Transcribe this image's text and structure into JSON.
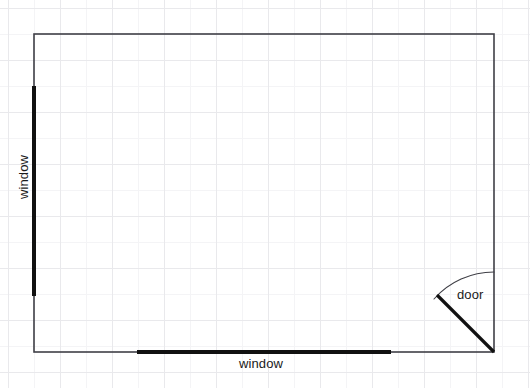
{
  "drawing": {
    "title": "room-floor-plan",
    "background": {
      "kind": "graph-paper",
      "minor_cell_px": 26,
      "major_cell_px": 52,
      "minor_color": "#f4f4f6",
      "major_color": "#e9e9ec",
      "paper_color": "#ffffff"
    },
    "canvas": {
      "width": 530,
      "height": 388
    },
    "room": {
      "name": "room-outline",
      "shape": "rectangle",
      "x": 34,
      "y": 34,
      "width": 460,
      "height": 318,
      "wall_color": "#3f3f46",
      "wall_thickness": 1.6
    },
    "openings": [
      {
        "id": "window-left",
        "type": "window",
        "label": "window",
        "wall": "left",
        "orientation": "vertical",
        "x": 34,
        "y1": 86,
        "y2": 296,
        "length": 210,
        "color": "#111111",
        "thickness": 4
      },
      {
        "id": "window-bottom",
        "type": "window",
        "label": "window",
        "wall": "bottom",
        "orientation": "horizontal",
        "y": 352,
        "x1": 137,
        "x2": 391,
        "length": 254,
        "color": "#111111",
        "thickness": 4
      },
      {
        "id": "door-bottom-right",
        "type": "door",
        "label": "door",
        "wall": "right",
        "hinge_x": 494,
        "hinge_y": 352,
        "radius": 80,
        "leaf_end_x": 437,
        "leaf_end_y": 295,
        "swing_start_x": 494,
        "swing_start_y": 272,
        "swing_degrees": 45,
        "leaf_color": "#111111",
        "leaf_thickness": 3.2,
        "arc_color": "#3f3f46",
        "arc_thickness": 1.1
      }
    ]
  }
}
